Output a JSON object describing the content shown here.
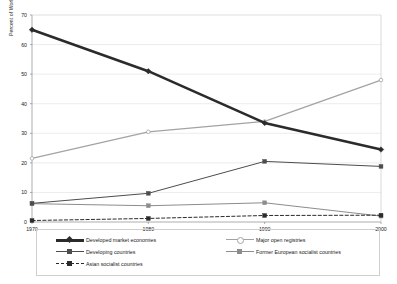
{
  "chart_data": {
    "type": "line",
    "title": "",
    "xlabel": "",
    "ylabel": "Percent of World total (DWT)",
    "x": [
      1970,
      1980,
      1990,
      2000
    ],
    "xticklabels": [
      "1970",
      "1980",
      "1990",
      "2000"
    ],
    "yticklabels": [
      "0",
      "10",
      "20",
      "30",
      "40",
      "50",
      "60",
      "70"
    ],
    "yticks": [
      0,
      10,
      20,
      30,
      40,
      50,
      60,
      70
    ],
    "xlim": [
      1970,
      2000
    ],
    "ylim": [
      0,
      70
    ],
    "grid": true,
    "grid_axis": "y",
    "legend_position": "bottom",
    "series": [
      {
        "name": "Developed market economies",
        "values": [
          65,
          51,
          33.5,
          24.5
        ],
        "color": "#2b2b2b",
        "width": 2.6,
        "dash": "solid",
        "marker": "diamond"
      },
      {
        "name": "Major open registries",
        "values": [
          21.5,
          30.5,
          34,
          48
        ],
        "color": "#a3a3a3",
        "width": 1.3,
        "dash": "solid",
        "marker": "circle"
      },
      {
        "name": "Developing countries",
        "values": [
          6.3,
          9.7,
          20.5,
          18.8
        ],
        "color": "#4d4d4d",
        "width": 1.0,
        "dash": "solid",
        "marker": "square"
      },
      {
        "name": "Former European socialist countries",
        "values": [
          6.2,
          5.5,
          6.5,
          2.0
        ],
        "color": "#8c8c8c",
        "width": 1.0,
        "dash": "solid",
        "marker": "square"
      },
      {
        "name": "Asian socialist countries",
        "values": [
          0.5,
          1.2,
          2.2,
          2.3
        ],
        "color": "#2b2b2b",
        "width": 1.0,
        "dash": "dashed",
        "marker": "square"
      }
    ]
  },
  "axes": {
    "plot_left": 32,
    "plot_right": 381,
    "plot_top": 15,
    "plot_bottom": 222
  },
  "legend": {
    "items": [
      {
        "label": "Developed market economies",
        "col": 0,
        "row": 0
      },
      {
        "label": "Developing countries",
        "col": 0,
        "row": 1
      },
      {
        "label": "Asian socialist countries",
        "col": 0,
        "row": 2
      },
      {
        "label": "Major open registries",
        "col": 1,
        "row": 0
      },
      {
        "label": "Former European socialist countries",
        "col": 1,
        "row": 1
      }
    ]
  }
}
